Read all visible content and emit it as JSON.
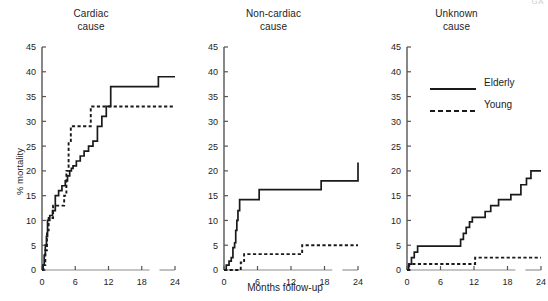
{
  "figure": {
    "axis_label_y": "% mortality",
    "axis_label_x": "Months follow-up",
    "corner_mark": "GA"
  },
  "legend": {
    "position": "top-right of third panel",
    "entries": [
      {
        "label": "Elderly",
        "style": "solid",
        "color": "#1a1a1a"
      },
      {
        "label": "Young",
        "style": "dashed",
        "color": "#1a1a1a"
      }
    ]
  },
  "panels": [
    {
      "title": "Cardiac\ncause"
    },
    {
      "title": "Non-cardiac\ncause"
    },
    {
      "title": "Unknown\ncause"
    }
  ],
  "chart_data": {
    "type": "line",
    "xlabel": "Months follow-up",
    "ylabel": "% mortality",
    "xlim": [
      0,
      24
    ],
    "ylim": [
      0,
      45
    ],
    "xticks": [
      0,
      6,
      12,
      18,
      24
    ],
    "yticks": [
      0,
      5,
      10,
      15,
      20,
      25,
      30,
      35,
      40,
      45
    ],
    "grid": false,
    "legend_position": "upper right (third panel)",
    "panels": [
      {
        "name": "Cardiac cause",
        "series": [
          {
            "name": "Elderly",
            "style": "solid",
            "step": "post",
            "x": [
              0,
              0.2,
              0.4,
              0.6,
              0.8,
              1.0,
              1.4,
              1.9,
              2.4,
              3.0,
              3.6,
              4.2,
              4.6,
              5.0,
              5.3,
              5.6,
              6.2,
              6.9,
              7.6,
              8.4,
              9.2,
              10.0,
              10.8,
              11.6,
              12.4,
              16.4,
              21.0,
              24
            ],
            "y": [
              0,
              1.0,
              3.0,
              5.0,
              6.8,
              10.0,
              11.0,
              12.0,
              15.0,
              16.0,
              17.0,
              18.0,
              19.0,
              20.0,
              20.5,
              21.0,
              22.0,
              23.0,
              24.0,
              25.0,
              26.0,
              29.0,
              31.0,
              33.0,
              37.0,
              37.0,
              39.0,
              39.0
            ]
          },
          {
            "name": "Young",
            "style": "dashed",
            "step": "post",
            "x": [
              0,
              0.3,
              0.6,
              0.9,
              1.2,
              2.0,
              3.0,
              4.0,
              4.4,
              4.8,
              5.2,
              5.6,
              6.0,
              8.8,
              24
            ],
            "y": [
              0,
              1.0,
              4.0,
              8.0,
              10.5,
              13.0,
              13.0,
              15.0,
              20.0,
              26.0,
              29.0,
              29.0,
              29.0,
              33.0,
              33.0
            ]
          }
        ]
      },
      {
        "name": "Non-cardiac cause",
        "series": [
          {
            "name": "Elderly",
            "style": "solid",
            "step": "post",
            "x": [
              0,
              0.4,
              0.9,
              1.3,
              1.6,
              1.9,
              2.1,
              2.3,
              2.5,
              2.8,
              6.3,
              13.3,
              17.4,
              24
            ],
            "y": [
              0,
              1.0,
              1.8,
              2.5,
              4.5,
              5.5,
              8.0,
              10.0,
              12.0,
              14.2,
              16.2,
              16.2,
              18.0,
              21.7
            ]
          },
          {
            "name": "Young",
            "style": "dashed",
            "step": "post",
            "x": [
              0,
              2.3,
              3.0,
              3.6,
              13.2,
              14.0,
              24
            ],
            "y": [
              0,
              0.0,
              1.5,
              3.2,
              3.2,
              5.0,
              5.0
            ]
          }
        ]
      },
      {
        "name": "Unknown cause",
        "series": [
          {
            "name": "Elderly",
            "style": "solid",
            "step": "post",
            "x": [
              0,
              0.3,
              0.8,
              1.3,
              1.9,
              9.0,
              9.6,
              10.1,
              10.6,
              11.2,
              11.7,
              13.2,
              14.0,
              15.0,
              16.4,
              18.6,
              20.4,
              21.4,
              22.2,
              24
            ],
            "y": [
              0,
              1.2,
              2.5,
              3.6,
              4.8,
              4.8,
              6.2,
              7.4,
              8.6,
              9.7,
              10.6,
              10.6,
              11.8,
              13.0,
              14.2,
              15.2,
              17.2,
              18.5,
              20.0,
              20.0
            ]
          },
          {
            "name": "Young",
            "style": "dashed",
            "step": "post",
            "x": [
              0,
              0.4,
              11.8,
              12.2,
              24
            ],
            "y": [
              0,
              1.2,
              1.2,
              2.5,
              2.5
            ]
          }
        ]
      }
    ]
  }
}
